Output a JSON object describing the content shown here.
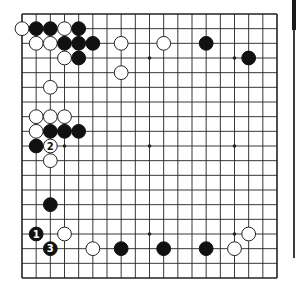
{
  "diagram": {
    "type": "go-board-diagram",
    "board_size": 19,
    "visible_region": "full board",
    "colors": {
      "background": "#ffffff",
      "line": "#222222",
      "black_stone": "#111111",
      "white_stone_fill": "#ffffff",
      "white_stone_border": "#222222"
    },
    "star_points": [
      [
        3,
        3
      ],
      [
        9,
        3
      ],
      [
        15,
        3
      ],
      [
        3,
        9
      ],
      [
        9,
        9
      ],
      [
        15,
        9
      ],
      [
        3,
        15
      ],
      [
        9,
        15
      ],
      [
        15,
        15
      ]
    ],
    "stones": [
      {
        "color": "white",
        "col": 0,
        "row": 1
      },
      {
        "color": "black",
        "col": 1,
        "row": 1
      },
      {
        "color": "black",
        "col": 2,
        "row": 1
      },
      {
        "color": "white",
        "col": 3,
        "row": 1
      },
      {
        "color": "black",
        "col": 4,
        "row": 1
      },
      {
        "color": "white",
        "col": 1,
        "row": 2
      },
      {
        "color": "white",
        "col": 2,
        "row": 2
      },
      {
        "color": "black",
        "col": 3,
        "row": 2
      },
      {
        "color": "black",
        "col": 4,
        "row": 2
      },
      {
        "color": "black",
        "col": 5,
        "row": 2
      },
      {
        "color": "white",
        "col": 7,
        "row": 2
      },
      {
        "color": "white",
        "col": 10,
        "row": 2
      },
      {
        "color": "black",
        "col": 13,
        "row": 2
      },
      {
        "color": "white",
        "col": 3,
        "row": 3
      },
      {
        "color": "black",
        "col": 4,
        "row": 3
      },
      {
        "color": "black",
        "col": 16,
        "row": 3
      },
      {
        "color": "white",
        "col": 7,
        "row": 4
      },
      {
        "color": "white",
        "col": 2,
        "row": 5
      },
      {
        "color": "white",
        "col": 1,
        "row": 7
      },
      {
        "color": "white",
        "col": 2,
        "row": 7
      },
      {
        "color": "white",
        "col": 3,
        "row": 7
      },
      {
        "color": "white",
        "col": 1,
        "row": 8
      },
      {
        "color": "black",
        "col": 2,
        "row": 8
      },
      {
        "color": "black",
        "col": 3,
        "row": 8
      },
      {
        "color": "black",
        "col": 4,
        "row": 8
      },
      {
        "color": "black",
        "col": 1,
        "row": 9
      },
      {
        "color": "white",
        "col": 2,
        "row": 9,
        "label": "2"
      },
      {
        "color": "white",
        "col": 2,
        "row": 10
      },
      {
        "color": "black",
        "col": 2,
        "row": 13
      },
      {
        "color": "black",
        "col": 1,
        "row": 15,
        "label": "1"
      },
      {
        "color": "white",
        "col": 3,
        "row": 15
      },
      {
        "color": "white",
        "col": 16,
        "row": 15
      },
      {
        "color": "black",
        "col": 2,
        "row": 16,
        "label": "3"
      },
      {
        "color": "white",
        "col": 5,
        "row": 16
      },
      {
        "color": "black",
        "col": 7,
        "row": 16
      },
      {
        "color": "black",
        "col": 10,
        "row": 16
      },
      {
        "color": "black",
        "col": 13,
        "row": 16
      },
      {
        "color": "white",
        "col": 15,
        "row": 16
      }
    ],
    "move_labels": [
      "1",
      "2",
      "3"
    ]
  }
}
